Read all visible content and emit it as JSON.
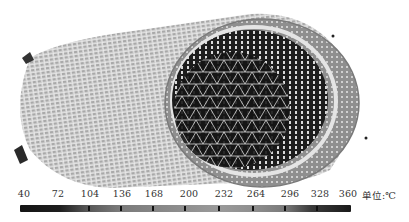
{
  "figure": {
    "colors": {
      "outer_mesh": "#c9c9c9",
      "outer_ring": "#9a9a9a",
      "inner_bore": "#1a1a1a",
      "mesh_lines": "#f2f2f2"
    }
  },
  "legend": {
    "ticks": [
      "40",
      "72",
      "104",
      "136",
      "168",
      "200",
      "232",
      "264",
      "296",
      "328",
      "360"
    ],
    "unit_label": "单位:℃",
    "min": 40,
    "max": 360,
    "step": 32
  }
}
